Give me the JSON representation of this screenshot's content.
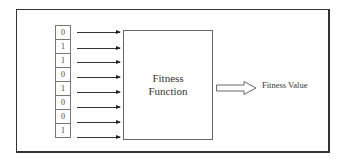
{
  "diagram": {
    "bits": [
      "0",
      "1",
      "1",
      "0",
      "1",
      "0",
      "0",
      "1"
    ],
    "function_box": {
      "line1": "Fitness",
      "line2": "Function"
    },
    "output_label": "Fitness Value"
  }
}
